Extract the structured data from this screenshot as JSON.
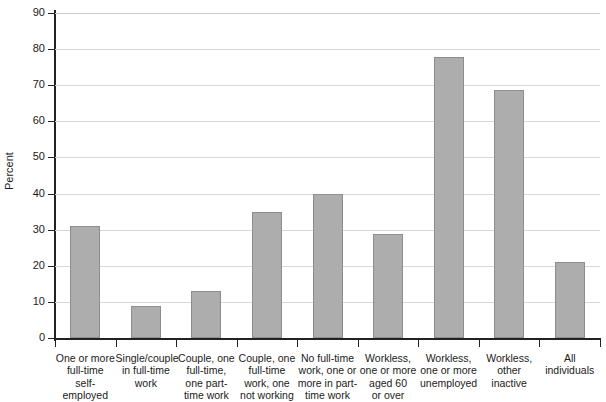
{
  "chart_data": {
    "type": "bar",
    "title": "",
    "xlabel": "",
    "ylabel": "Percent",
    "ylim": [
      0,
      90
    ],
    "ytick_step": 10,
    "yticks": [
      0,
      10,
      20,
      30,
      40,
      50,
      60,
      70,
      80,
      90
    ],
    "ytick_labels": [
      "0",
      "10",
      "20",
      "30",
      "40",
      "50",
      "60",
      "70",
      "80",
      "90"
    ],
    "grid": true,
    "grid_axis": "y",
    "legend": false,
    "bar_color": "#adadad",
    "bar_edge_color": "#8d8d8d",
    "axis_color": "#222222",
    "grid_color": "#d8d8d8",
    "categories": [
      "One or more full-time self-employed",
      "Single/couple in full-time work",
      "Couple, one full-time, one part-time work",
      "Couple, one full-time work, one not working",
      "No full-time work, one or more in part-time work",
      "Workless, one or more aged 60 or over",
      "Workless, one or more unemployed",
      "Workless, other inactive",
      "All individuals"
    ],
    "category_label_lines": [
      [
        "One or more",
        "full-time",
        "self-",
        "employed"
      ],
      [
        "Single/couple",
        "in full-time",
        "work"
      ],
      [
        "Couple, one",
        "full-time,",
        "one part-",
        "time work"
      ],
      [
        "Couple, one",
        "full-time",
        "work, one",
        "not working"
      ],
      [
        "No full-time",
        "work, one or",
        "more in part-",
        "time work"
      ],
      [
        "Workless,",
        "one or more",
        "aged 60",
        "or over"
      ],
      [
        "Workless,",
        "one or more",
        "unemployed"
      ],
      [
        "Workless,",
        "other inactive"
      ],
      [
        "All individuals"
      ]
    ],
    "values": [
      31,
      9,
      13,
      35,
      40,
      28.8,
      77.8,
      68.8,
      21
    ]
  }
}
